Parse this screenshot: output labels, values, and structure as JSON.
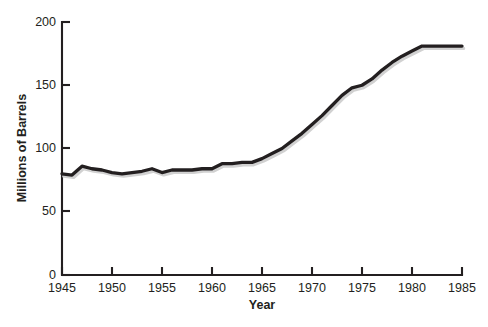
{
  "chart_data": {
    "type": "line",
    "title": "",
    "xlabel": "Year",
    "ylabel": "Millions of Barrels",
    "xlim": [
      1945,
      1985
    ],
    "ylim": [
      0,
      200
    ],
    "grid": false,
    "legend": "none",
    "xticks": [
      "1945",
      "1950",
      "1955",
      "1960",
      "1965",
      "1970",
      "1975",
      "1980",
      "1985"
    ],
    "xtick_values": [
      1945,
      1950,
      1955,
      1960,
      1965,
      1970,
      1975,
      1980,
      1985
    ],
    "yticks": [
      "0",
      "50",
      "100",
      "150",
      "200"
    ],
    "ytick_values": [
      0,
      50,
      100,
      150,
      200
    ],
    "line_color": "#231f20",
    "series": [
      {
        "name": "Production",
        "x": [
          1945,
          1946,
          1947,
          1948,
          1949,
          1950,
          1951,
          1952,
          1953,
          1954,
          1955,
          1956,
          1957,
          1958,
          1959,
          1960,
          1961,
          1962,
          1963,
          1964,
          1965,
          1966,
          1967,
          1968,
          1969,
          1970,
          1971,
          1972,
          1973,
          1974,
          1975,
          1976,
          1977,
          1978,
          1979,
          1980,
          1981,
          1982,
          1983,
          1984,
          1985
        ],
        "values": [
          80,
          79,
          86,
          84,
          83,
          81,
          80,
          81,
          82,
          84,
          81,
          83,
          83,
          83,
          84,
          84,
          88,
          88,
          89,
          89,
          92,
          96,
          100,
          106,
          112,
          119,
          126,
          134,
          142,
          148,
          150,
          155,
          162,
          168,
          173,
          177,
          181,
          181,
          181,
          181,
          181
        ]
      }
    ]
  },
  "caption": {
    "text": ""
  }
}
